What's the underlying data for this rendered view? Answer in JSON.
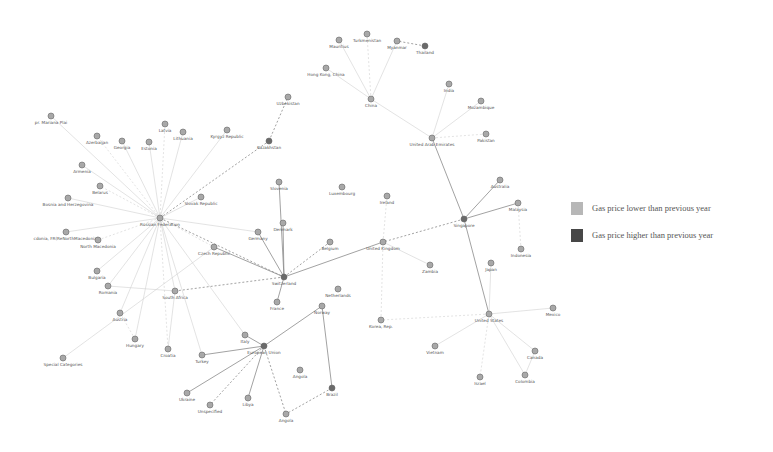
{
  "legend": {
    "items": [
      {
        "label": "Gas price lower than previous year",
        "color": "#b7b7b7"
      },
      {
        "label": "Gas price higher than previous year",
        "color": "#474747"
      }
    ]
  },
  "nodes": [
    {
      "id": "mauritius",
      "label": "Mauritius",
      "x": 339,
      "y": 40
    },
    {
      "id": "turkmenistan",
      "label": "Turkmenistan",
      "x": 367,
      "y": 34
    },
    {
      "id": "myanmar",
      "label": "Myanmar",
      "x": 397,
      "y": 41
    },
    {
      "id": "thailand",
      "label": "Thailand",
      "x": 425,
      "y": 46
    },
    {
      "id": "hongkong",
      "label": "Hong Kong, China",
      "x": 326,
      "y": 68
    },
    {
      "id": "china",
      "label": "China",
      "x": 371,
      "y": 99
    },
    {
      "id": "india",
      "label": "India",
      "x": 449,
      "y": 84
    },
    {
      "id": "mozambique",
      "label": "Mozambique",
      "x": 481,
      "y": 101
    },
    {
      "id": "pakistan",
      "label": "Pakistan",
      "x": 486,
      "y": 134
    },
    {
      "id": "uae",
      "label": "United Arab Emirates",
      "x": 432,
      "y": 138
    },
    {
      "id": "uzbekistan",
      "label": "Uzbekistan",
      "x": 288,
      "y": 97
    },
    {
      "id": "kyrgyz",
      "label": "Kyrgyz Republic",
      "x": 227,
      "y": 130
    },
    {
      "id": "kazakhstan",
      "label": "Kazakhstan",
      "x": 269,
      "y": 141
    },
    {
      "id": "northernmariana",
      "label": "pr. Mariana Plai",
      "x": 51,
      "y": 116
    },
    {
      "id": "azerbaijan",
      "label": "Azerbaijan",
      "x": 97,
      "y": 136
    },
    {
      "id": "georgia",
      "label": "Georgia",
      "x": 122,
      "y": 141
    },
    {
      "id": "estonia",
      "label": "Estonia",
      "x": 149,
      "y": 142
    },
    {
      "id": "latvia",
      "label": "Latvia",
      "x": 165,
      "y": 124
    },
    {
      "id": "lithuania",
      "label": "Lithuania",
      "x": 183,
      "y": 132
    },
    {
      "id": "armenia",
      "label": "Armenia",
      "x": 82,
      "y": 165
    },
    {
      "id": "belarus",
      "label": "Belarus",
      "x": 100,
      "y": 186
    },
    {
      "id": "bosnia",
      "label": "Bosnia and Herzegovina",
      "x": 68,
      "y": 198
    },
    {
      "id": "russia",
      "label": "Russian Federation",
      "x": 160,
      "y": 218
    },
    {
      "id": "slovakrep",
      "label": "Slovak Republic",
      "x": 201,
      "y": 197
    },
    {
      "id": "macedonia",
      "label": "cdonia, FR(ReNorthMacedonia)",
      "x": 66,
      "y": 232
    },
    {
      "id": "northmacedonia",
      "label": "North Macedonia",
      "x": 98,
      "y": 240
    },
    {
      "id": "bulgaria",
      "label": "Bulgaria",
      "x": 97,
      "y": 271
    },
    {
      "id": "romania",
      "label": "Romania",
      "x": 108,
      "y": 286
    },
    {
      "id": "czech",
      "label": "Czech Republic",
      "x": 214,
      "y": 247
    },
    {
      "id": "slovenia",
      "label": "Slovenia",
      "x": 279,
      "y": 182
    },
    {
      "id": "luxembourg",
      "label": "Luxembourg",
      "x": 342,
      "y": 187
    },
    {
      "id": "ireland",
      "label": "Ireland",
      "x": 387,
      "y": 196
    },
    {
      "id": "denmark",
      "label": "Denmark",
      "x": 283,
      "y": 223
    },
    {
      "id": "germany",
      "label": "Germany",
      "x": 258,
      "y": 232
    },
    {
      "id": "belgium",
      "label": "Belgium",
      "x": 330,
      "y": 242
    },
    {
      "id": "uk",
      "label": "United Kingdom",
      "x": 383,
      "y": 242
    },
    {
      "id": "zambia",
      "label": "Zambia",
      "x": 430,
      "y": 265
    },
    {
      "id": "switzerland",
      "label": "Switzerland",
      "x": 284,
      "y": 277
    },
    {
      "id": "france",
      "label": "France",
      "x": 277,
      "y": 302
    },
    {
      "id": "netherlands",
      "label": "Netherlands",
      "x": 338,
      "y": 289
    },
    {
      "id": "norway",
      "label": "Norway",
      "x": 322,
      "y": 306
    },
    {
      "id": "korea",
      "label": "Korea, Rep.",
      "x": 381,
      "y": 320
    },
    {
      "id": "southafrica",
      "label": "South Africa",
      "x": 175,
      "y": 291
    },
    {
      "id": "austria",
      "label": "Austria",
      "x": 120,
      "y": 313
    },
    {
      "id": "hungary",
      "label": "Hungary",
      "x": 135,
      "y": 339
    },
    {
      "id": "croatia",
      "label": "Croatia",
      "x": 168,
      "y": 349
    },
    {
      "id": "turkey",
      "label": "Turkey",
      "x": 202,
      "y": 355
    },
    {
      "id": "specialcat",
      "label": "Special Categories",
      "x": 63,
      "y": 358
    },
    {
      "id": "italy",
      "label": "Italy",
      "x": 245,
      "y": 335
    },
    {
      "id": "euroarea",
      "label": "European Union",
      "x": 264,
      "y": 346
    },
    {
      "id": "angola1",
      "label": "Angola",
      "x": 300,
      "y": 370
    },
    {
      "id": "ukraine",
      "label": "Ukraine",
      "x": 187,
      "y": 393
    },
    {
      "id": "unspecified",
      "label": "Unspecified",
      "x": 210,
      "y": 405
    },
    {
      "id": "libya",
      "label": "Libya",
      "x": 248,
      "y": 398
    },
    {
      "id": "angola2",
      "label": "Angola",
      "x": 286,
      "y": 414
    },
    {
      "id": "brazil",
      "label": "Brazil",
      "x": 332,
      "y": 388
    },
    {
      "id": "australia",
      "label": "Australia",
      "x": 500,
      "y": 180
    },
    {
      "id": "singapore",
      "label": "Singapore",
      "x": 464,
      "y": 219
    },
    {
      "id": "malaysia",
      "label": "Malaysia",
      "x": 518,
      "y": 203
    },
    {
      "id": "indonesia",
      "label": "Indonesia",
      "x": 521,
      "y": 249
    },
    {
      "id": "japan",
      "label": "Japan",
      "x": 491,
      "y": 263
    },
    {
      "id": "us",
      "label": "United States",
      "x": 489,
      "y": 314
    },
    {
      "id": "mexico",
      "label": "Mexico",
      "x": 553,
      "y": 308
    },
    {
      "id": "vietnam",
      "label": "Vietnam",
      "x": 435,
      "y": 346
    },
    {
      "id": "israel",
      "label": "Israel",
      "x": 480,
      "y": 377
    },
    {
      "id": "canada",
      "label": "Canada",
      "x": 535,
      "y": 351
    },
    {
      "id": "colombia",
      "label": "Colombia",
      "x": 525,
      "y": 375
    }
  ],
  "edges": [
    [
      "russia",
      "northernmariana"
    ],
    [
      "russia",
      "azerbaijan"
    ],
    [
      "russia",
      "georgia"
    ],
    [
      "russia",
      "estonia"
    ],
    [
      "russia",
      "latvia"
    ],
    [
      "russia",
      "lithuania"
    ],
    [
      "russia",
      "armenia"
    ],
    [
      "russia",
      "belarus"
    ],
    [
      "russia",
      "bosnia"
    ],
    [
      "russia",
      "macedonia"
    ],
    [
      "russia",
      "northmacedonia"
    ],
    [
      "russia",
      "bulgaria"
    ],
    [
      "russia",
      "romania"
    ],
    [
      "russia",
      "kazakhstan"
    ],
    [
      "russia",
      "kyrgyz"
    ],
    [
      "russia",
      "slovakrep"
    ],
    [
      "russia",
      "czech"
    ],
    [
      "russia",
      "southafrica"
    ],
    [
      "russia",
      "turkey"
    ],
    [
      "russia",
      "switzerland"
    ],
    [
      "russia",
      "hungary"
    ],
    [
      "russia",
      "austria"
    ],
    [
      "russia",
      "croatia"
    ],
    [
      "russia",
      "italy"
    ],
    [
      "russia",
      "germany"
    ],
    [
      "kazakhstan",
      "uzbekistan"
    ],
    [
      "china",
      "hongkong"
    ],
    [
      "china",
      "mauritius"
    ],
    [
      "china",
      "turkmenistan"
    ],
    [
      "china",
      "myanmar"
    ],
    [
      "china",
      "uae"
    ],
    [
      "thailand",
      "myanmar"
    ],
    [
      "uae",
      "india"
    ],
    [
      "uae",
      "mozambique"
    ],
    [
      "uae",
      "pakistan"
    ],
    [
      "uae",
      "singapore"
    ],
    [
      "singapore",
      "australia"
    ],
    [
      "singapore",
      "uk"
    ],
    [
      "singapore",
      "malaysia"
    ],
    [
      "singapore",
      "us"
    ],
    [
      "malaysia",
      "indonesia"
    ],
    [
      "us",
      "japan"
    ],
    [
      "us",
      "mexico"
    ],
    [
      "us",
      "korea"
    ],
    [
      "us",
      "canada"
    ],
    [
      "us",
      "colombia"
    ],
    [
      "us",
      "israel"
    ],
    [
      "us",
      "vietnam"
    ],
    [
      "canada",
      "colombia"
    ],
    [
      "uk",
      "korea"
    ],
    [
      "uk",
      "switzerland"
    ],
    [
      "uk",
      "zambia"
    ],
    [
      "uk",
      "ireland"
    ],
    [
      "switzerland",
      "germany"
    ],
    [
      "switzerland",
      "denmark"
    ],
    [
      "switzerland",
      "belgium"
    ],
    [
      "switzerland",
      "slovenia"
    ],
    [
      "switzerland",
      "france"
    ],
    [
      "switzerland",
      "southafrica"
    ],
    [
      "switzerland",
      "czech"
    ],
    [
      "euroarea",
      "italy"
    ],
    [
      "euroarea",
      "angola2"
    ],
    [
      "euroarea",
      "turkey"
    ],
    [
      "euroarea",
      "libya"
    ],
    [
      "euroarea",
      "unspecified"
    ],
    [
      "euroarea",
      "norway"
    ],
    [
      "brazil",
      "norway"
    ],
    [
      "brazil",
      "angola2"
    ],
    [
      "southafrica",
      "croatia"
    ],
    [
      "southafrica",
      "romania"
    ],
    [
      "hungary",
      "austria"
    ],
    [
      "specialcat",
      "czech"
    ],
    [
      "ukraine",
      "euroarea"
    ]
  ],
  "dark_nodes": [
    "switzerland",
    "euroarea",
    "brazil",
    "kazakhstan",
    "thailand",
    "singapore"
  ]
}
